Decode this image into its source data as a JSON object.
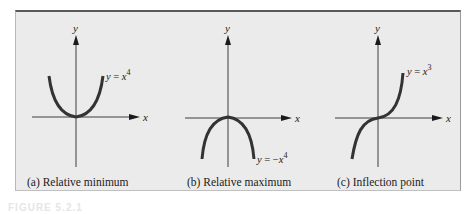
{
  "figure": {
    "number_label": "FIGURE 5.2.1",
    "panels": [
      {
        "id": "a",
        "caption": "(a) Relative minimum",
        "x_axis_label": "x",
        "y_axis_label": "y",
        "equation": {
          "lhs": "y",
          "eq": " = ",
          "base": "x",
          "exp": "4",
          "prefix": ""
        },
        "function": "y = x^4",
        "feature": "relative minimum at origin"
      },
      {
        "id": "b",
        "caption": "(b) Relative maximum",
        "x_axis_label": "x",
        "y_axis_label": "y",
        "equation": {
          "lhs": "y",
          "eq": " = ",
          "base": "x",
          "exp": "4",
          "prefix": "−"
        },
        "function": "y = -x^4",
        "feature": "relative maximum at origin"
      },
      {
        "id": "c",
        "caption": "(c) Inflection point",
        "x_axis_label": "x",
        "y_axis_label": "y",
        "equation": {
          "lhs": "y",
          "eq": " = ",
          "base": "x",
          "exp": "3",
          "prefix": ""
        },
        "function": "y = x^3",
        "feature": "inflection point at origin"
      }
    ],
    "colors": {
      "background": "#ebebeb",
      "curve": "#333333",
      "axis": "#2a2a2a",
      "top_border": "#5a5a5a"
    }
  }
}
